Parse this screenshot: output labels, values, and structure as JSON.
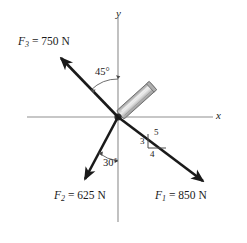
{
  "figure": {
    "type": "free-body-force-diagram",
    "background_color": "#ffffff",
    "stroke_color": "#1a1a1a",
    "axis_color": "#8a8a8a",
    "rod_fill": "#b8b8b8",
    "rod_highlight": "#e4e4e4",
    "axes": {
      "x_label": "x",
      "y_label": "y",
      "origin_px": [
        118,
        117
      ]
    },
    "rod": {
      "name": "bracket-rod",
      "angle_deg_from_x_axis": 42,
      "length_px": 44,
      "width_px": 11
    },
    "forces": [
      {
        "id": "F1",
        "symbol": "F",
        "subscript": "1",
        "equals": "=",
        "magnitude": "850 N",
        "label": "F₁ = 850 N",
        "direction": "down-right",
        "slope_ratio": {
          "rise": 3,
          "run": 4,
          "hyp": 5
        },
        "tip_px": [
          206,
          183
        ],
        "tail_px": [
          118,
          117
        ]
      },
      {
        "id": "F2",
        "symbol": "F",
        "subscript": "2",
        "equals": "=",
        "magnitude": "625 N",
        "label": "F₂ = 625 N",
        "direction": "down-left",
        "angle_deg": 30,
        "angle_reference": "negative y-axis",
        "tip_px": [
          82,
          182
        ],
        "tail_px": [
          118,
          117
        ]
      },
      {
        "id": "F3",
        "symbol": "F",
        "subscript": "3",
        "equals": "=",
        "magnitude": "750 N",
        "label": "F₃ = 750 N",
        "direction": "up-left",
        "angle_deg": 45,
        "angle_reference": "positive y-axis",
        "tip_px": [
          58,
          55
        ],
        "tail_px": [
          118,
          117
        ]
      }
    ],
    "annotations": {
      "angle_45": "45°",
      "angle_30": "30°",
      "triangle_vertical": "3",
      "triangle_horizontal": "4",
      "triangle_hypotenuse": "5"
    }
  }
}
